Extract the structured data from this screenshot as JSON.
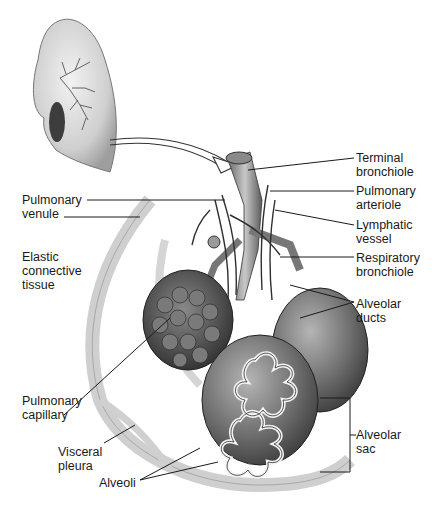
{
  "figure": {
    "labels": {
      "terminal_bronchiole": "Terminal\nbronchiole",
      "pulmonary_arteriole": "Pulmonary\narteriole",
      "lymphatic_vessel": "Lymphatic\nvessel",
      "respiratory_bronchiole": "Respiratory\nbronchiole",
      "alveolar_ducts": "Alveolar\nducts",
      "alveolar_sac": "Alveolar\nsac",
      "pulmonary_venule": "Pulmonary\nvenule",
      "elastic_connective_tissue": "Elastic\nconnective\ntissue",
      "pulmonary_capillary": "Pulmonary\ncapillary",
      "visceral_pleura": "Visceral\npleura",
      "alveoli": "Alveoli"
    },
    "colors": {
      "ink": "#1a1a1a",
      "tissue_light": "#d9d9d9",
      "tissue_mid": "#9a9a9a",
      "tissue_dark": "#4a4a4a"
    }
  }
}
